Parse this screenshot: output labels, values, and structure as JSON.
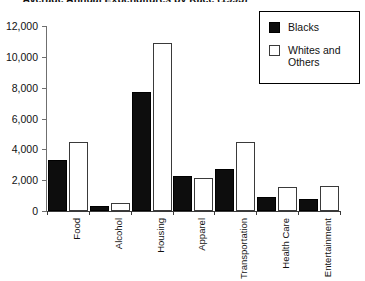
{
  "chart_data": {
    "type": "bar",
    "title": "Average Annual Expenditures by Race (1993)",
    "xlabel": "",
    "ylabel": "",
    "ylim": [
      0,
      12000
    ],
    "ytick_values": [
      0,
      2000,
      4000,
      6000,
      8000,
      10000,
      12000
    ],
    "ytick_labels": [
      "0",
      "2,000",
      "4,000",
      "6,000",
      "8,000",
      "10,000",
      "12,000"
    ],
    "grid": false,
    "legend_position": "upper-right",
    "categories": [
      "Food",
      "Alcohol",
      "Housing",
      "Apparel",
      "Transportation",
      "Health Care",
      "Entertainment"
    ],
    "series": [
      {
        "name": "Blacks",
        "color": "#0d0d0d",
        "fill": "solid",
        "values": [
          3300,
          300,
          7700,
          2250,
          2700,
          900,
          750
        ]
      },
      {
        "name": "Whites and Others",
        "color": "#ffffff",
        "fill": "hollow",
        "values": [
          4500,
          550,
          10900,
          2150,
          4500,
          1550,
          1600
        ]
      }
    ]
  },
  "legend": {
    "entries": [
      {
        "label": "Blacks",
        "swatch": "filled-square-icon"
      },
      {
        "label": "Whites and\nOthers",
        "swatch": "empty-square-icon"
      }
    ]
  }
}
